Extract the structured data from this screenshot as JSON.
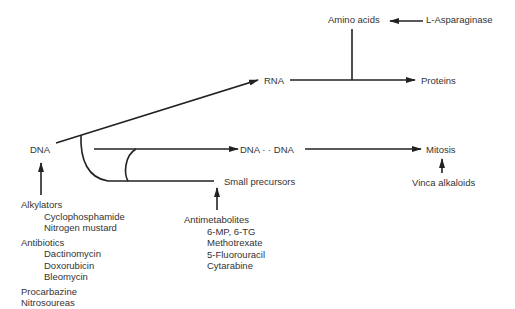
{
  "diagram": {
    "type": "biochemical-pathway",
    "nodes": {
      "dna": "DNA",
      "rna": "RNA",
      "proteins": "Proteins",
      "amino_acids": "Amino acids",
      "dna_dna": "DNA · · DNA",
      "mitosis": "Mitosis",
      "small_precursors": "Small precursors"
    },
    "inhibitors": {
      "asparaginase": "L-Asparaginase",
      "vinca": "Vinca alkaloids"
    },
    "dna_inhibitor_groups": [
      {
        "title": "Alkylators",
        "items": [
          "Cyclophosphamide",
          "Nitrogen mustard"
        ]
      },
      {
        "title": "Antibiotics",
        "items": [
          "Dactinomycin",
          "Doxorubicin",
          "Bleomycin"
        ]
      },
      {
        "title": "",
        "items": [
          "Procarbazine",
          "Nitrosoureas"
        ]
      }
    ],
    "antimetabolites": {
      "title": "Antimetabolites",
      "items": [
        "6-MP, 6-TG",
        "Methotrexate",
        "5-Fluorouracil",
        "Cytarabine"
      ]
    },
    "edges": [
      {
        "from": "DNA",
        "to": "RNA"
      },
      {
        "from": "RNA",
        "to": "Proteins"
      },
      {
        "from": "Amino acids",
        "to": "RNA→Proteins"
      },
      {
        "from": "L-Asparaginase",
        "to": "Amino acids",
        "type": "inhibit"
      },
      {
        "from": "DNA",
        "to": "DNA · · DNA",
        "via": "Small precursors"
      },
      {
        "from": "DNA · · DNA",
        "to": "Mitosis"
      },
      {
        "from": "Vinca alkaloids",
        "to": "Mitosis",
        "type": "inhibit"
      },
      {
        "from": "Antimetabolites",
        "to": "Small precursors",
        "type": "inhibit"
      },
      {
        "from": "Alkylators/Antibiotics/Procarbazine/Nitrosoureas",
        "to": "DNA",
        "type": "inhibit"
      }
    ]
  }
}
